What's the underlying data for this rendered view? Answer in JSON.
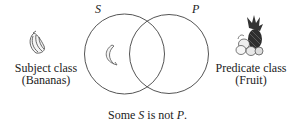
{
  "diagram": {
    "circle_left_label": "S",
    "circle_right_label": "P",
    "subject": {
      "line1": "Subject class",
      "line2": "(Bananas)",
      "icon": "bananas-icon"
    },
    "predicate": {
      "line1": "Predicate class",
      "line2": "(Fruit)",
      "icon": "fruit-basket-icon"
    },
    "inner_marker_icon": "banana-icon",
    "caption": {
      "pre": "Some ",
      "s": "S",
      "mid": " is not ",
      "p": "P",
      "post": "."
    },
    "colors": {
      "stroke": "#555555",
      "text": "#222222"
    }
  }
}
